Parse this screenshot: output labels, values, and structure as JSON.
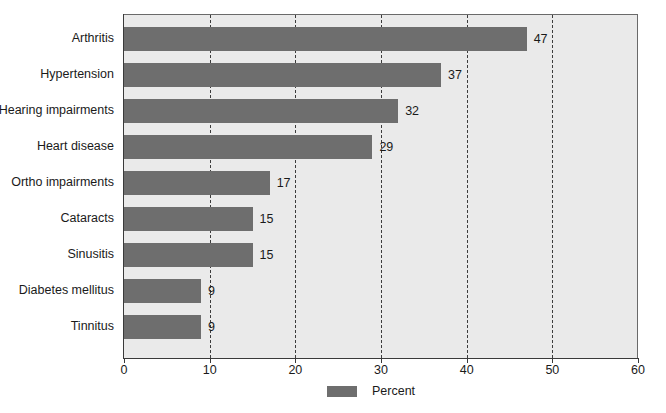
{
  "chart_data": {
    "type": "bar",
    "orientation": "horizontal",
    "title": "",
    "xlabel": "",
    "ylabel": "",
    "xlim": [
      0,
      60
    ],
    "xticks": [
      0,
      10,
      20,
      30,
      40,
      50,
      60
    ],
    "grid": true,
    "grid_style": "dashed-vertical",
    "legend": {
      "position": "bottom-center",
      "entries": [
        {
          "label": "Percent",
          "color": "#6e6e6e"
        }
      ]
    },
    "categories": [
      "Arthritis",
      "Hypertension",
      "Hearing impairments",
      "Heart disease",
      "Ortho impairments",
      "Cataracts",
      "Sinusitis",
      "Diabetes mellitus",
      "Tinnitus"
    ],
    "values": [
      47,
      37,
      32,
      29,
      17,
      15,
      15,
      9,
      9
    ],
    "value_labels": [
      "47",
      "37",
      "32",
      "29",
      "17",
      "15",
      "15",
      "9",
      "9"
    ],
    "series": [
      {
        "name": "Percent",
        "color": "#6e6e6e",
        "values": [
          47,
          37,
          32,
          29,
          17,
          15,
          15,
          9,
          9
        ]
      }
    ]
  },
  "colors": {
    "bar": "#6e6e6e",
    "plot_background": "#eaeaea",
    "gridline": "#3c3c3c",
    "axis": "#3a3a3a",
    "text": "#1a1a1a",
    "page_background": "#ffffff"
  }
}
